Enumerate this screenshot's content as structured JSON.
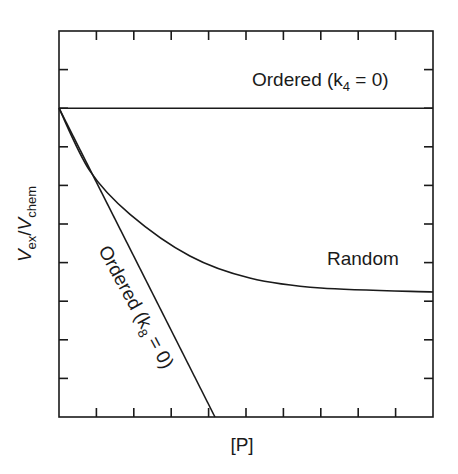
{
  "chart_data": {
    "type": "line",
    "title": "",
    "xlabel": "[P]",
    "ylabel": "Vex/Vchem",
    "ylabel_parts": {
      "main1": "V",
      "sub1": "ex",
      "slash": "/",
      "main2": "V",
      "sub2": "chem"
    },
    "xlim": [
      0,
      10
    ],
    "ylim": [
      0,
      10
    ],
    "x_ticks_count": 10,
    "y_ticks_count": 10,
    "tick_labels_shown": false,
    "grid": false,
    "legend": null,
    "series": [
      {
        "name": "Ordered (k4 = 0)",
        "label_main": "Ordered (k",
        "label_sub": "4",
        "label_tail": " = 0)",
        "shape": "horizontal",
        "x": [
          0,
          10
        ],
        "y": [
          8,
          8
        ]
      },
      {
        "name": "Random",
        "label_main": "Random",
        "shape": "curve",
        "x": [
          0,
          0.83,
          1.9,
          3.5,
          5.1,
          7.0,
          10
        ],
        "y": [
          8,
          6.37,
          5.25,
          4.17,
          3.6,
          3.34,
          3.24
        ]
      },
      {
        "name": "Ordered (k8 = 0)",
        "label_main": "Ordered (k",
        "label_sub": "8",
        "label_tail": " = 0)",
        "shape": "straight",
        "x": [
          0,
          4.17
        ],
        "y": [
          8,
          0
        ]
      }
    ],
    "annotations": [
      {
        "text": "Ordered (k4 = 0)",
        "position": "upper right, above horizontal line"
      },
      {
        "text": "Random",
        "position": "right, above random curve asymptote"
      },
      {
        "text": "Ordered (k8 = 0)",
        "position": "rotated along descending straight line"
      }
    ],
    "line_color": "#1a1a1a",
    "background": "#ffffff"
  }
}
